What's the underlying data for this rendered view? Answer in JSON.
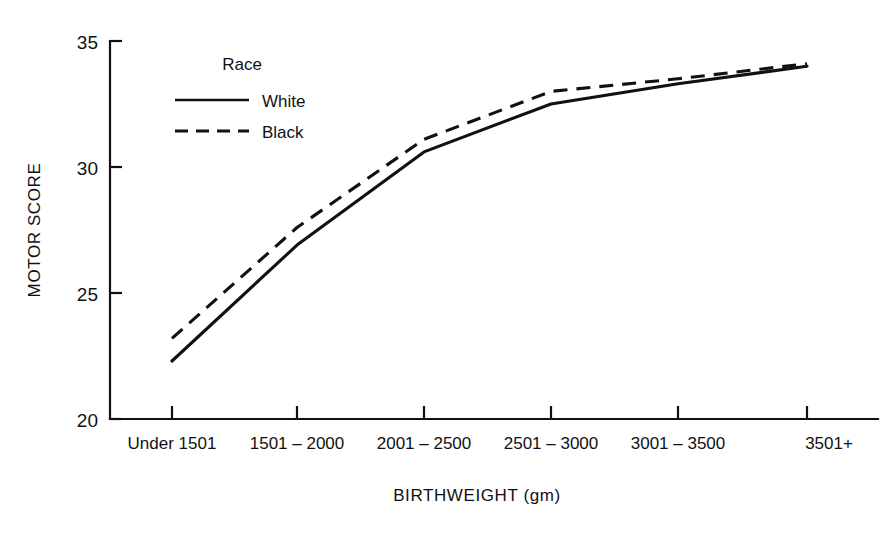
{
  "figure": {
    "background_color": "#ffffff",
    "ink_color": "#111111",
    "cropped_title": "MOTOR SCORES BY BIRTHWEIGHT"
  },
  "axes": {
    "y_title": "MOTOR SCORE",
    "x_title": "BIRTHWEIGHT (gm)",
    "y_ticks": [
      "20",
      "25",
      "30",
      "35"
    ],
    "x_ticks": [
      "Under 1501",
      "1501 – 2000",
      "2001 – 2500",
      "2501 – 3000",
      "3001 – 3500",
      "3501+"
    ]
  },
  "legend": {
    "title": "Race",
    "entries": [
      {
        "label": "White",
        "style": "solid"
      },
      {
        "label": "Black",
        "style": "dashed"
      }
    ]
  },
  "chart_data": {
    "type": "line",
    "title": "MOTOR SCORES BY BIRTHWEIGHT",
    "xlabel": "BIRTHWEIGHT (gm)",
    "ylabel": "MOTOR SCORE",
    "categories": [
      "Under 1501",
      "1501 – 2000",
      "2001 – 2500",
      "2501 – 3000",
      "3001 – 3500",
      "3501+"
    ],
    "series": [
      {
        "name": "White",
        "style": "solid",
        "values": [
          22.3,
          26.9,
          30.6,
          32.5,
          33.3,
          34.0
        ]
      },
      {
        "name": "Black",
        "style": "dashed",
        "values": [
          23.2,
          27.6,
          31.1,
          33.0,
          33.5,
          34.1
        ]
      }
    ],
    "ylim": [
      20,
      35
    ],
    "y_tick_values": [
      20,
      25,
      30,
      35
    ],
    "grid": false,
    "legend_position": "inside-upper-left",
    "legend_title": "Race"
  }
}
